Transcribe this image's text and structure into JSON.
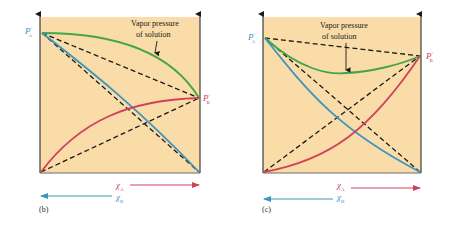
{
  "colors": {
    "background_plot": "#f9dca8",
    "solution": "#43a548",
    "component_a": "#3a95bf",
    "component_b": "#d0405a",
    "ideal": "#1a1a1a",
    "label_a": "#3a95bf",
    "label_b": "#d0405a"
  },
  "panels": [
    {
      "id": "b",
      "caption": "(b)",
      "annotation_line1": "Vapor pressure",
      "annotation_line2": "of solution",
      "pa_label": "P",
      "pa_sub": "A",
      "pa_sup": "°",
      "pb_label": "P",
      "pb_sub": "B",
      "pb_sup": "°",
      "xa_label": "χ",
      "xa_sub": "A",
      "xb_label": "χ",
      "xb_sub": "B",
      "deviation": "positive"
    },
    {
      "id": "c",
      "caption": "(c)",
      "annotation_line1": "Vapor pressure",
      "annotation_line2": "of solution",
      "pa_label": "P",
      "pa_sub": "A",
      "pa_sup": "°",
      "pb_label": "P",
      "pb_sub": "B",
      "pb_sup": "°",
      "xa_label": "χ",
      "xa_sub": "A",
      "xb_label": "χ",
      "xb_sub": "B",
      "deviation": "negative"
    }
  ]
}
